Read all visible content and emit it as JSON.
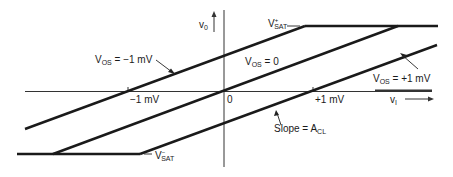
{
  "diagram": {
    "axes": {
      "y_label": "v",
      "y_label_sub": "0",
      "x_label": "v",
      "x_label_sub": "I",
      "origin_label": "0"
    },
    "ticks": [
      {
        "label": "−1 mV",
        "x": 128
      },
      {
        "label": "+1 mV",
        "x": 313
      }
    ],
    "saturation": {
      "positive": {
        "label": "V",
        "sub": "SAT",
        "sup": "+"
      },
      "negative": {
        "label": "V",
        "sub": "SAT",
        "sup": "−"
      }
    },
    "curves": [
      {
        "name": "V_OS = −1 mV",
        "label": "V",
        "sub": "OS",
        "value": " = −1 mV"
      },
      {
        "name": "V_OS = 0",
        "label": "V",
        "sub": "OS",
        "value": " = 0"
      },
      {
        "name": "V_OS = +1 mV",
        "label": "V",
        "sub": "OS",
        "value": " = +1 mV"
      }
    ],
    "slope": {
      "label": "Slope = A",
      "sub": "CL"
    },
    "line_color": "#1a1a1a",
    "axis_color": "#333333"
  }
}
